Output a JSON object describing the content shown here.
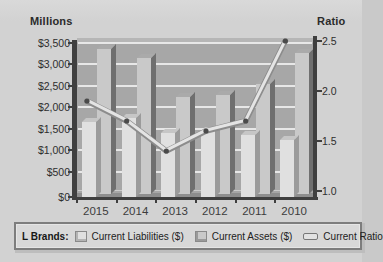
{
  "chart_data": {
    "type": "combo-3d-bar-line",
    "categories": [
      "2015",
      "2014",
      "2013",
      "2012",
      "2011",
      "2010"
    ],
    "series": [
      {
        "name": "Current Liabilities ($)",
        "type": "bar",
        "axis": "left",
        "values": [
          1700,
          1800,
          1450,
          1500,
          1400,
          1300
        ]
      },
      {
        "name": "Current Assets ($)",
        "type": "bar",
        "axis": "left",
        "values": [
          3300,
          3100,
          2200,
          2250,
          2500,
          3200
        ]
      },
      {
        "name": "Current Ratio",
        "type": "line",
        "axis": "right",
        "values": [
          1.9,
          1.7,
          1.4,
          1.6,
          1.7,
          2.5
        ]
      }
    ],
    "left_axis": {
      "title": "Millions",
      "min": 0,
      "max": 3500,
      "step": 500,
      "tick_labels": [
        "$3,500",
        "$3,000",
        "$2,500",
        "$2,000",
        "$1,500",
        "$1,000",
        "$500",
        "$0"
      ]
    },
    "right_axis": {
      "title": "Ratio",
      "min": 1.0,
      "max": 2.5,
      "step": 0.5,
      "tick_labels": [
        "2.5",
        "2.0",
        "1.5",
        "1.0"
      ]
    },
    "grid": true,
    "legend": {
      "position": "bottom",
      "prefix": "L Brands:",
      "entries": [
        "Current Liabilities ($)",
        "Current Assets ($)",
        "Current Ratio"
      ]
    }
  },
  "colors": {
    "background": "#d2d2d2",
    "wall": "#a7a7a7",
    "wall_top_band": "#b6b6b6",
    "floor": "#8e8e8e",
    "gridline": "#ededed",
    "axis": "#3f3f3f",
    "text": "#2e2e2e",
    "bar_liabilities_front": "#e0e0e0",
    "bar_liabilities_side": "#9b9b9b",
    "bar_assets_front": "#c9c9c9",
    "bar_assets_side": "#6f6f6f",
    "line_fill": "#e4e4e4",
    "line_edge": "#8c8c8c",
    "marker": "#4a4a4a",
    "legend_bg": "#d8d8d8",
    "legend_border": "#7d7d7d"
  }
}
